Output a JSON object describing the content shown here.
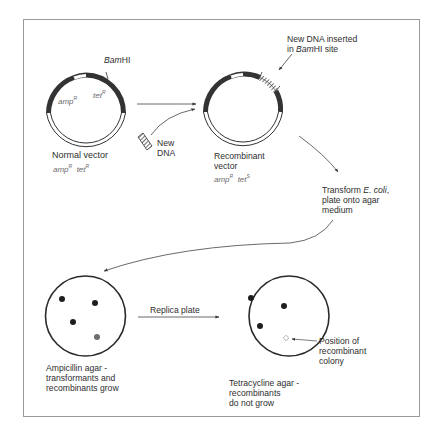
{
  "figure": {
    "normal_vector": {
      "site_label": "BamHI",
      "site_italic": "Bam",
      "site_roman": "HI",
      "gene_amp": "amp",
      "gene_amp_sup": "R",
      "gene_tet": "tet",
      "gene_tet_sup": "R",
      "caption": "Normal vector",
      "genotype": {
        "amp": "amp",
        "amp_sup": "R",
        "tet": "tet",
        "tet_sup": "R"
      }
    },
    "new_dna": {
      "line1": "New",
      "line2": "DNA"
    },
    "recombinant_vector": {
      "insert_label_line1": "New DNA inserted",
      "insert_label_line2_prefix": "in ",
      "insert_label_line2_italic": "Bam",
      "insert_label_line2_suffix": "HI site",
      "caption_line1": "Recombinant",
      "caption_line2": "vector",
      "genotype": {
        "amp": "amp",
        "amp_sup": "R",
        "tet": "tet",
        "tet_sup": "S"
      }
    },
    "transform_step": {
      "line1_prefix": "Transform ",
      "line1_italic": "E. coli",
      "line1_suffix": ",",
      "line2": "plate onto agar",
      "line3": "medium"
    },
    "replica_step": {
      "label": "Replica plate"
    },
    "ampicillin_plate": {
      "caption_line1": "Ampicillin agar -",
      "caption_line2": "transformants and",
      "caption_line3": "recombinants grow",
      "colonies": [
        {
          "type": "transformant"
        },
        {
          "type": "transformant"
        },
        {
          "type": "transformant"
        },
        {
          "type": "recombinant"
        }
      ]
    },
    "tetracycline_plate": {
      "caption_line1": "Tetracycline agar -",
      "caption_line2": "recombinants",
      "caption_line3": "do not grow",
      "colonies": [
        {
          "type": "transformant"
        },
        {
          "type": "transformant"
        },
        {
          "type": "transformant"
        },
        {
          "type": "missing-recombinant"
        }
      ],
      "pointer_line1": "Position of",
      "pointer_line2": "recombinant",
      "pointer_line3": "colony"
    },
    "colors": {
      "ink": "#2a2a2a",
      "gene_text": "#6a6a6a",
      "recombinant_colony": "#6e6e6e",
      "frame": "#9a9a9a"
    }
  }
}
